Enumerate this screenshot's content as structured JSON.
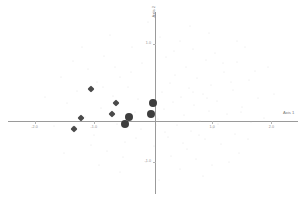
{
  "chart_data": {
    "type": "scatter",
    "title": "",
    "xlabel": "Axis 1",
    "ylabel": "Axis 2",
    "xlim": [
      -2.45,
      2.45
    ],
    "ylim": [
      -1.55,
      1.55
    ],
    "grid": false,
    "legend": null,
    "xticks": [
      {
        "value": -2.0,
        "label": "-2.0"
      },
      {
        "value": -1.0,
        "label": "-1.0"
      },
      {
        "value": 1.0,
        "label": "1.0"
      },
      {
        "value": 2.0,
        "label": "2.0"
      }
    ],
    "yticks": [
      {
        "value": 1.0,
        "label": "1.0"
      },
      {
        "value": -1.0,
        "label": "-1.0"
      }
    ],
    "series": [
      {
        "name": "diamond-markers",
        "marker": "diamond",
        "color": "#4a4a4a",
        "size": 7,
        "points": [
          {
            "x": -1.05,
            "y": 0.24
          },
          {
            "x": -1.22,
            "y": -0.26
          },
          {
            "x": -1.33,
            "y": -0.45
          },
          {
            "x": -0.7,
            "y": -0.19
          },
          {
            "x": -0.62,
            "y": 0.0
          }
        ]
      },
      {
        "name": "circle-markers",
        "marker": "circle",
        "color": "#3e3e3e",
        "size": 8,
        "points": [
          {
            "x": 0.0,
            "y": 0.0
          },
          {
            "x": -0.03,
            "y": -0.19
          },
          {
            "x": -0.4,
            "y": -0.23
          },
          {
            "x": -0.47,
            "y": -0.36
          }
        ]
      },
      {
        "name": "background-cloud",
        "marker": "dot",
        "color": "#c9c9c9",
        "size": 1,
        "points": [
          {
            "x": 0.12,
            "y": 1.12
          },
          {
            "x": 0.45,
            "y": 1.05
          },
          {
            "x": -0.35,
            "y": 0.95
          },
          {
            "x": 0.68,
            "y": 0.92
          },
          {
            "x": 1.05,
            "y": 0.86
          },
          {
            "x": -0.82,
            "y": 0.8
          },
          {
            "x": 0.22,
            "y": 0.78
          },
          {
            "x": 0.9,
            "y": 0.74
          },
          {
            "x": 1.42,
            "y": 0.7
          },
          {
            "x": -0.18,
            "y": 0.68
          },
          {
            "x": 0.55,
            "y": 0.62
          },
          {
            "x": -1.1,
            "y": 0.58
          },
          {
            "x": 0.05,
            "y": 0.55
          },
          {
            "x": 1.2,
            "y": 0.52
          },
          {
            "x": 0.38,
            "y": 0.48
          },
          {
            "x": -0.55,
            "y": 0.45
          },
          {
            "x": 0.75,
            "y": 0.42
          },
          {
            "x": 1.62,
            "y": 0.4
          },
          {
            "x": -0.95,
            "y": 0.36
          },
          {
            "x": 0.28,
            "y": 0.34
          },
          {
            "x": 0.98,
            "y": 0.3
          },
          {
            "x": -0.42,
            "y": 0.28
          },
          {
            "x": 0.6,
            "y": 0.25
          },
          {
            "x": 1.35,
            "y": 0.22
          },
          {
            "x": -1.28,
            "y": 0.2
          },
          {
            "x": 0.15,
            "y": 0.18
          },
          {
            "x": 0.85,
            "y": 0.15
          },
          {
            "x": -0.68,
            "y": 0.12
          },
          {
            "x": 0.48,
            "y": 0.1
          },
          {
            "x": 1.78,
            "y": 0.08
          },
          {
            "x": -0.25,
            "y": 0.06
          },
          {
            "x": 1.08,
            "y": 0.04
          },
          {
            "x": 0.33,
            "y": 0.02
          },
          {
            "x": -1.45,
            "y": 0.0
          },
          {
            "x": 0.7,
            "y": -0.03
          },
          {
            "x": 1.5,
            "y": -0.06
          },
          {
            "x": -0.88,
            "y": -0.08
          },
          {
            "x": 0.18,
            "y": -0.11
          },
          {
            "x": 0.95,
            "y": -0.14
          },
          {
            "x": -0.3,
            "y": -0.16
          },
          {
            "x": 1.25,
            "y": -0.18
          },
          {
            "x": 0.52,
            "y": -0.21
          },
          {
            "x": -1.15,
            "y": -0.24
          },
          {
            "x": 0.08,
            "y": -0.27
          },
          {
            "x": 0.8,
            "y": -0.3
          },
          {
            "x": 1.65,
            "y": -0.32
          },
          {
            "x": -0.6,
            "y": -0.35
          },
          {
            "x": 0.4,
            "y": -0.38
          },
          {
            "x": 1.02,
            "y": -0.42
          },
          {
            "x": -0.2,
            "y": -0.45
          },
          {
            "x": 0.65,
            "y": -0.48
          },
          {
            "x": 1.38,
            "y": -0.52
          },
          {
            "x": -1.0,
            "y": -0.55
          },
          {
            "x": 0.25,
            "y": -0.58
          },
          {
            "x": 0.88,
            "y": -0.62
          },
          {
            "x": -0.48,
            "y": -0.66
          },
          {
            "x": 1.15,
            "y": -0.7
          },
          {
            "x": 0.02,
            "y": -0.74
          },
          {
            "x": 0.58,
            "y": -0.78
          },
          {
            "x": -0.78,
            "y": -0.82
          },
          {
            "x": 1.45,
            "y": -0.86
          },
          {
            "x": 0.3,
            "y": -0.9
          },
          {
            "x": 0.72,
            "y": -0.95
          },
          {
            "x": -0.12,
            "y": -1.0
          },
          {
            "x": 1.0,
            "y": -1.05
          },
          {
            "x": 0.45,
            "y": -1.12
          },
          {
            "x": -0.55,
            "y": -1.18
          },
          {
            "x": 0.85,
            "y": -1.25
          },
          {
            "x": 0.1,
            "y": -1.32
          },
          {
            "x": 1.72,
            "y": 0.55
          },
          {
            "x": -1.55,
            "y": 0.45
          },
          {
            "x": 1.88,
            "y": -0.25
          },
          {
            "x": -1.68,
            "y": -0.4
          },
          {
            "x": 0.95,
            "y": 1.2
          },
          {
            "x": -0.72,
            "y": 1.15
          },
          {
            "x": 1.55,
            "y": 0.95
          },
          {
            "x": -1.35,
            "y": 0.72
          },
          {
            "x": 2.05,
            "y": 0.15
          },
          {
            "x": -1.82,
            "y": 0.1
          },
          {
            "x": 1.28,
            "y": -1.0
          },
          {
            "x": -0.92,
            "y": -1.05
          },
          {
            "x": 0.62,
            "y": 1.32
          },
          {
            "x": -0.08,
            "y": 1.38
          },
          {
            "x": 1.18,
            "y": 0.68
          },
          {
            "x": -0.38,
            "y": 0.52
          },
          {
            "x": 0.78,
            "y": -0.55
          },
          {
            "x": -1.05,
            "y": -0.72
          },
          {
            "x": 0.35,
            "y": 0.88
          },
          {
            "x": 1.42,
            "y": 1.05
          },
          {
            "x": -0.65,
            "y": 0.62
          },
          {
            "x": 0.5,
            "y": -0.68
          },
          {
            "x": 1.6,
            "y": -0.62
          },
          {
            "x": -1.2,
            "y": 0.95
          },
          {
            "x": 0.2,
            "y": -0.5
          },
          {
            "x": 1.1,
            "y": -0.35
          },
          {
            "x": -0.5,
            "y": -0.92
          },
          {
            "x": 0.92,
            "y": 0.08
          },
          {
            "x": -0.28,
            "y": -0.6
          },
          {
            "x": 1.32,
            "y": 0.35
          },
          {
            "x": -1.5,
            "y": -0.85
          },
          {
            "x": 0.68,
            "y": 0.18
          },
          {
            "x": 1.95,
            "y": 0.62
          },
          {
            "x": -0.85,
            "y": 0.28
          },
          {
            "x": 0.05,
            "y": -0.38
          },
          {
            "x": 1.48,
            "y": -0.15
          }
        ]
      }
    ]
  }
}
